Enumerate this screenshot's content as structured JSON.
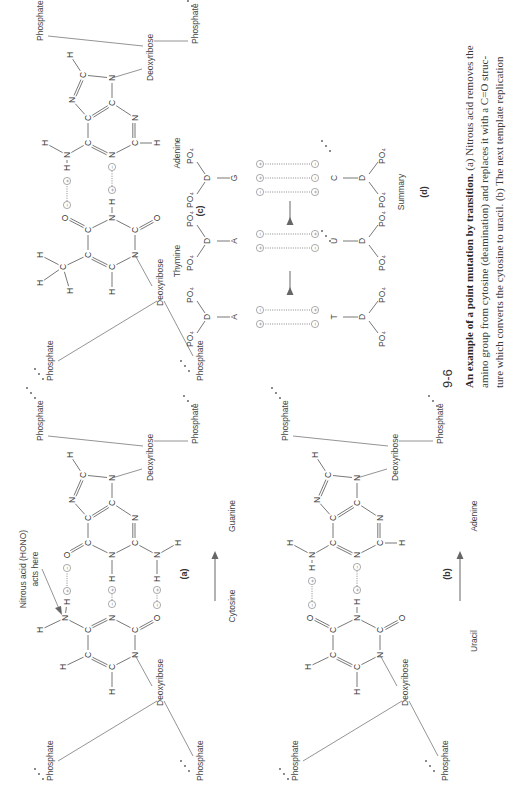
{
  "figure": {
    "number": "9-6",
    "caption_title": "An example of a point mutation by transition.",
    "caption_lines": [
      " (a) Nitrous acid removes the",
      "amino group from cytosine (deamination) and replaces it with a C=O struc-",
      "ture which converts the cytosine to uracil. (b) The next template replication"
    ]
  },
  "panels": {
    "a": {
      "label": "(a)",
      "left_base": "Cytosine",
      "right_base": "Guanine",
      "annotation_line1": "Nitrous acid (HONO)",
      "annotation_line2": "acts here"
    },
    "b": {
      "label": "(b)",
      "left_base": "Uracil",
      "right_base": "Adenine"
    },
    "c": {
      "label": "(c)",
      "left_base": "Thymine",
      "right_base": "Adenine"
    },
    "d": {
      "label": "(d)",
      "title": "Summary",
      "steps": [
        {
          "left": "C",
          "right": "G",
          "left_charges": [
            "+",
            "-",
            "-"
          ],
          "right_charges": [
            "-",
            "+",
            "+"
          ]
        },
        {
          "left": "U",
          "right": "A",
          "left_charges": [
            "-",
            "+"
          ],
          "right_charges": [
            "+",
            "-"
          ]
        },
        {
          "left": "T",
          "right": "A",
          "left_charges": [
            "-",
            "+"
          ],
          "right_charges": [
            "+",
            "-"
          ]
        }
      ],
      "sugar": "D",
      "phosphate": "PO₄"
    }
  },
  "labels": {
    "phosphate": "Phosphate",
    "deoxyribose": "Deoxyribose",
    "ellipsis": "…"
  },
  "atoms": {
    "C": "C",
    "N": "N",
    "O": "O",
    "H": "H"
  },
  "charges": {
    "plus": "+",
    "minus": "−"
  }
}
